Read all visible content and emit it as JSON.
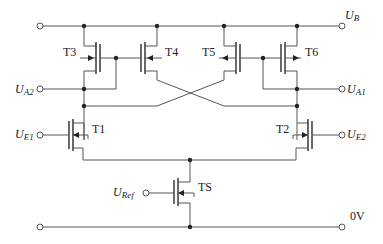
{
  "diagram": {
    "type": "CMOS flip-flop / differential circuit schematic",
    "supply": {
      "top_label_main": "U",
      "top_label_sub": "B",
      "bottom_label": "0V"
    },
    "inputs": {
      "ua2": {
        "main": "U",
        "sub": "A2"
      },
      "ua1": {
        "main": "U",
        "sub": "A1"
      },
      "ue1": {
        "main": "U",
        "sub": "E1"
      },
      "ue2": {
        "main": "U",
        "sub": "E2"
      },
      "uref": {
        "main": "U",
        "sub": "Ref"
      }
    },
    "transistors": {
      "t1": "T1",
      "t2": "T2",
      "t3": "T3",
      "t4": "T4",
      "t5": "T5",
      "t6": "T6",
      "ts": "TS"
    },
    "colors": {
      "wire": "#555555",
      "node": "#222222",
      "background": "#ffffff"
    }
  }
}
